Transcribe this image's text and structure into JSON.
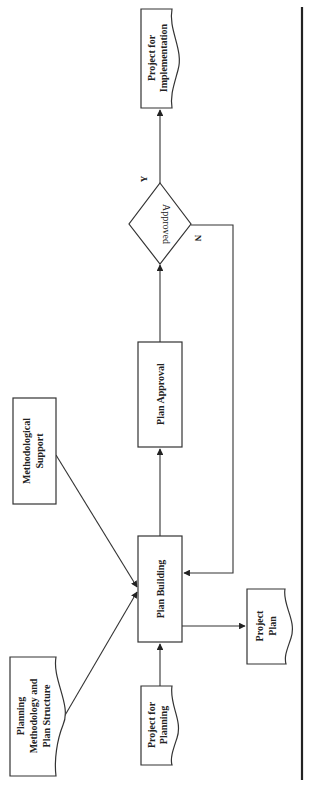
{
  "diagram": {
    "orientation": "rotated-90-ccw",
    "nodes": {
      "project_for_implementation": {
        "line1": "Project for",
        "line2": "Implementation",
        "shape": "document"
      },
      "approved": {
        "label": "Approved",
        "shape": "decision"
      },
      "plan_approval": {
        "label": "Plan Approval",
        "shape": "process"
      },
      "plan_building": {
        "label": "Plan Building",
        "shape": "process"
      },
      "methodological_support": {
        "line1": "Methodological",
        "line2": "Support",
        "shape": "process"
      },
      "project_plan": {
        "line1": "Project",
        "line2": "Plan",
        "shape": "document"
      },
      "planning_methodology": {
        "line1": "Planning",
        "line2": "Methodology and",
        "line3": "Plan Structure",
        "shape": "document"
      },
      "project_for_planning": {
        "line1": "Project for",
        "line2": "Planning",
        "shape": "document"
      }
    },
    "edge_labels": {
      "yes": "Y",
      "no": "N"
    },
    "edges": [
      {
        "from": "project_for_planning",
        "to": "plan_building"
      },
      {
        "from": "planning_methodology",
        "to": "plan_building"
      },
      {
        "from": "methodological_support",
        "to": "plan_building"
      },
      {
        "from": "plan_building",
        "to": "project_plan"
      },
      {
        "from": "plan_building",
        "to": "plan_approval"
      },
      {
        "from": "plan_approval",
        "to": "approved"
      },
      {
        "from": "approved",
        "to": "project_for_implementation",
        "label": "Y"
      },
      {
        "from": "approved",
        "to": "plan_building",
        "label": "N"
      }
    ],
    "colors": {
      "stroke": "#333333",
      "text": "#222222",
      "background": "#ffffff",
      "rule": "#222222"
    }
  }
}
